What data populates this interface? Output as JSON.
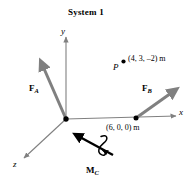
{
  "figure": {
    "title": "System 1",
    "background_color": "#ffffff",
    "axes": {
      "x_label": "x",
      "y_label": "y",
      "z_label": "z",
      "color": "#808080"
    },
    "forces": [
      {
        "name": "F_A",
        "label_main": "F",
        "label_sub": "A",
        "color": "#808080",
        "applied_at": "origin"
      },
      {
        "name": "F_B",
        "label_main": "F",
        "label_sub": "B",
        "color": "#808080",
        "applied_at": "point-b"
      }
    ],
    "moment": {
      "name": "M_C",
      "label_main": "M",
      "label_sub": "C",
      "color": "#000000"
    },
    "points": [
      {
        "name": "point-p",
        "label": "P",
        "coordinates_text": "(4, 3, –2) m"
      },
      {
        "name": "point-b",
        "label": "",
        "coordinates_text": "(6, 0, 0) m"
      }
    ]
  }
}
